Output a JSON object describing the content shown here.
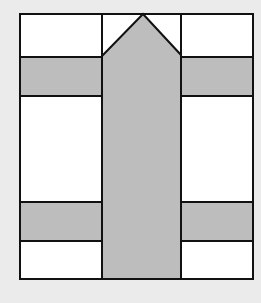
{
  "diagram": {
    "colors": {
      "background": "#ebebeb",
      "white": "#ffffff",
      "gray_fill": "#bdbdbd",
      "stroke": "#111111"
    },
    "frame": {
      "x": 20,
      "y": 14,
      "width": 233,
      "height": 265
    },
    "columns": {
      "left": {
        "x": 20,
        "width": 82
      },
      "center": {
        "x": 102,
        "width": 79
      },
      "right": {
        "x": 181,
        "width": 72
      }
    },
    "bands": [
      {
        "name": "top-band",
        "y": 57,
        "height": 39
      },
      {
        "name": "bottom-band",
        "y": 202,
        "height": 39
      }
    ],
    "arrow": {
      "points": "102,56 143,14 181,55 181,279 102,279",
      "direction": "up"
    }
  }
}
